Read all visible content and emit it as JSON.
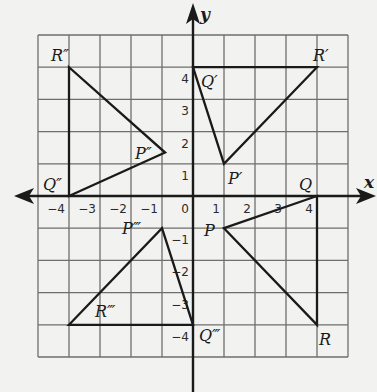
{
  "diagram": {
    "type": "coordinate-plane-transformations",
    "x_axis": {
      "label": "x",
      "min": -5,
      "max": 5,
      "tick_labels": [
        "-4",
        "-3",
        "-2",
        "-1",
        "0",
        "1",
        "2",
        "3",
        "4"
      ],
      "tick_values": [
        -4,
        -3,
        -2,
        -1,
        0,
        1,
        2,
        3,
        4
      ]
    },
    "y_axis": {
      "label": "y",
      "min": -5,
      "max": 5,
      "tick_labels": [
        "4",
        "3",
        "2",
        "1",
        "0",
        "-1",
        "-2",
        "-3",
        "-4"
      ],
      "tick_values": [
        4,
        3,
        2,
        1,
        0,
        -1,
        -2,
        -3,
        -4
      ]
    },
    "grid": true,
    "triangles": [
      {
        "name": "PQR",
        "vertices": [
          {
            "label": "P",
            "x": 1,
            "y": -1
          },
          {
            "label": "Q",
            "x": 4,
            "y": 0
          },
          {
            "label": "R",
            "x": 4,
            "y": -4
          }
        ]
      },
      {
        "name": "P'Q'R'",
        "vertices": [
          {
            "label": "P′",
            "x": 1,
            "y": 1
          },
          {
            "label": "Q′",
            "x": 0,
            "y": 4
          },
          {
            "label": "R′",
            "x": 4,
            "y": 4
          }
        ]
      },
      {
        "name": "P''Q''R''",
        "vertices": [
          {
            "label": "P″",
            "x": -0.9,
            "y": 1.35
          },
          {
            "label": "Q″",
            "x": -4,
            "y": 0
          },
          {
            "label": "R″",
            "x": -4,
            "y": 4
          }
        ]
      },
      {
        "name": "P'''Q'''R'''",
        "vertices": [
          {
            "label": "P‴",
            "x": -1,
            "y": -1
          },
          {
            "label": "Q‴",
            "x": 0,
            "y": -4
          },
          {
            "label": "R‴",
            "x": -4,
            "y": -4
          }
        ]
      }
    ]
  }
}
